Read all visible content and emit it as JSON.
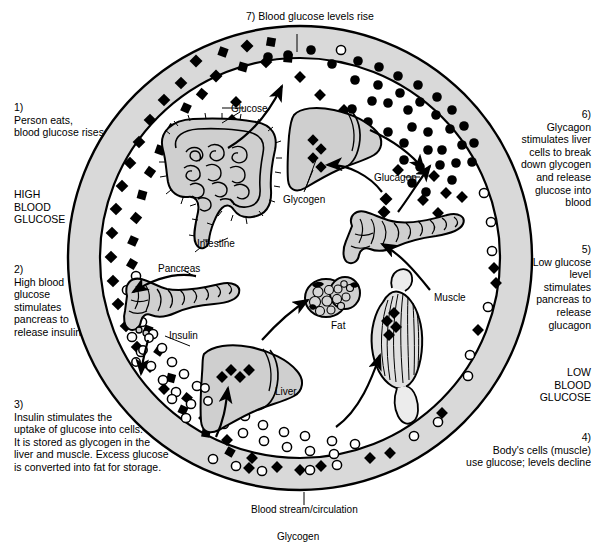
{
  "diagram": {
    "title_top": "7) Blood glucose levels rise",
    "bottom_caption": "Blood stream/circulation",
    "bottom_legend": "Glycogen"
  },
  "steps": [
    {
      "id": "step1",
      "number": "1)",
      "text": "Person eats,\nblood glucose rises"
    },
    {
      "id": "step2",
      "number": "2)",
      "text": "High blood\nglucose\nstimulates\npancreas to\nrelease insulin"
    },
    {
      "id": "step3",
      "number": "3)",
      "text": "Insulin stimulates the\nuptake of glucose into cells.\nIt is stored as glycogen in the\nliver and muscle. Excess glucose\nis converted into fat for storage."
    },
    {
      "id": "step4",
      "number": "4)",
      "text": "Body's cells (muscle)\nuse glucose; levels decline"
    },
    {
      "id": "step5",
      "number": "5)",
      "text": "Low glucose\nlevel\nstimulates\npancreas to\nrelease\nglucagon"
    },
    {
      "id": "step6",
      "number": "6)",
      "text": "Glycagon\nstimulates liver\ncells to break\ndown glycogen\nand release\nglucose into\nblood"
    },
    {
      "id": "step7",
      "number": "7)",
      "text": "Blood glucose levels rise"
    }
  ],
  "state_labels": {
    "high": "HIGH\nBLOOD\nGLUCOSE",
    "low": "LOW\nBLOOD\nGLUCOSE"
  },
  "organ_labels": {
    "intestine": "Intestine",
    "pancreas_top": "Pancreas",
    "liver_bottom": "Liver",
    "fat": "Fat",
    "muscle": "Muscle",
    "glycogen_liver": "Glycogen"
  },
  "molecule_labels": {
    "glucose": "Glucose",
    "insulin": "Insulin",
    "glucagon": "Glucagon"
  },
  "colors": {
    "ring_fill": "#d9d9d9",
    "organ_fill": "#cfcfcf",
    "stroke": "#000000",
    "page_bg": "#ffffff"
  },
  "geometry": {
    "center_x": 300,
    "center_y": 258,
    "outer_radius": 232,
    "inner_radius": 200
  }
}
